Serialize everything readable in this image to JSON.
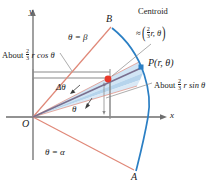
{
  "figure": {
    "axes": {
      "x_label": "x",
      "y_label": "y",
      "origin_label": "O"
    },
    "points": {
      "upper_ray_end": "B",
      "lower_ray_end": "A",
      "arc_point": "P(r, θ)",
      "centroid_dot_color": "#e8392a",
      "arc_point_color": "#2b7fc4"
    },
    "labels": {
      "centroid_title": "Centroid",
      "centroid_value_approx": "≈",
      "centroid_value_num": "2",
      "centroid_value_den": "3",
      "centroid_value_tail": "r, θ",
      "upper_ray": "θ = β",
      "lower_ray": "θ = α",
      "delta_theta": "Δθ",
      "theta": "θ",
      "about_cos_prefix": "About",
      "about_cos_num": "2",
      "about_cos_den": "3",
      "about_cos_tail": "r cos θ",
      "about_sin_prefix": "About",
      "about_sin_num": "2",
      "about_sin_den": "3",
      "about_sin_tail": "r sin θ"
    },
    "colors": {
      "arc": "#2b7fc4",
      "rays": "#e08878",
      "wedge_band": "#bcd9ef",
      "centroid_ray": "#7a6f8e",
      "axis": "#6e6e6e",
      "guide": "#8a8a8a",
      "text": "#1a1a1a"
    }
  }
}
